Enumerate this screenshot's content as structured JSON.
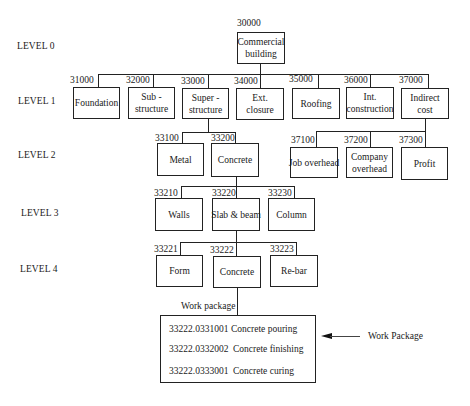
{
  "levels": [
    "LEVEL 0",
    "LEVEL 1",
    "LEVEL 2",
    "LEVEL 3",
    "LEVEL 4"
  ],
  "level0": {
    "code": "30000",
    "label": "Commercial building"
  },
  "level1": [
    {
      "code": "31000",
      "label": "Foundation"
    },
    {
      "code": "32000",
      "label": "Sub - structure"
    },
    {
      "code": "33000",
      "label": "Super - structure"
    },
    {
      "code": "34000",
      "label": "Ext. closure"
    },
    {
      "code": "35000",
      "label": "Roofing"
    },
    {
      "code": "36000",
      "label": "Int. construction"
    },
    {
      "code": "37000",
      "label": "Indirect cost"
    }
  ],
  "level2_super": [
    {
      "code": "33100",
      "label": "Metal"
    },
    {
      "code": "33200",
      "label": "Concrete"
    }
  ],
  "level2_indirect": [
    {
      "code": "37100",
      "label": "Job overhead"
    },
    {
      "code": "37200",
      "label": "Company overhead"
    },
    {
      "code": "37300",
      "label": "Profit"
    }
  ],
  "level3": [
    {
      "code": "33210",
      "label": "Walls"
    },
    {
      "code": "33220",
      "label": "Slab & beam"
    },
    {
      "code": "33230",
      "label": "Column"
    }
  ],
  "level4": [
    {
      "code": "33221",
      "label": "Form"
    },
    {
      "code": "33222",
      "label": "Concrete"
    },
    {
      "code": "33223",
      "label": "Re-bar"
    }
  ],
  "work_package": {
    "caption": "Work package",
    "items": [
      {
        "code": "33222.0331001",
        "name": "Concrete pouring"
      },
      {
        "code": "33222.0332002",
        "name": "Concrete finishing"
      },
      {
        "code": "33222.0333001",
        "name": "Concrete curing"
      }
    ]
  },
  "annotation": {
    "label": "Work Package",
    "icon": "arrow-left-icon"
  }
}
